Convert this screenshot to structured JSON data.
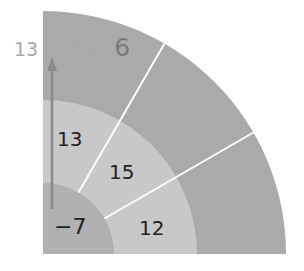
{
  "diagram": {
    "type": "quarter-circle-ring-diagram",
    "equation": {
      "lhs": "13 − 7 =",
      "result": "6"
    },
    "rings": {
      "inner": {
        "label": "−7",
        "color": "#b0b0b0"
      },
      "middle": {
        "sections": [
          "13",
          "15",
          "12"
        ],
        "color": "#c8c8c8"
      },
      "outer": {
        "color": "#aaaaaa"
      }
    },
    "arrow_color": "#8a8a8a",
    "separator_color": "#ffffff"
  }
}
